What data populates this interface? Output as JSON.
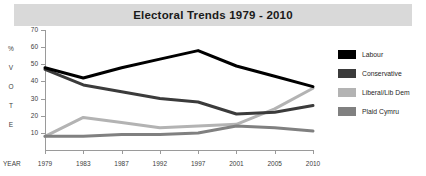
{
  "title": "Electoral Trends 1979 - 2010",
  "axis": {
    "y_letters": [
      "%",
      "V",
      "O",
      "T",
      "E"
    ],
    "y_ticks": [
      70,
      60,
      50,
      40,
      30,
      20,
      10
    ],
    "year_caption": "YEAR"
  },
  "legend": {
    "items": [
      {
        "label": "Labour",
        "color": "#000000"
      },
      {
        "label": "Conservative",
        "color": "#3b3b3b"
      },
      {
        "label": "Liberal/Lib Dem",
        "color": "#b3b3b3"
      },
      {
        "label": "Plaid Cymru",
        "color": "#808080"
      }
    ]
  },
  "chart_data": {
    "type": "line",
    "title": "Electoral Trends 1979 - 2010",
    "xlabel": "YEAR",
    "ylabel": "%VOTE",
    "categories": [
      "1979",
      "1983",
      "1987",
      "1992",
      "1997",
      "2001",
      "2005",
      "2010"
    ],
    "ylim": [
      0,
      70
    ],
    "yticks": [
      10,
      20,
      30,
      40,
      50,
      60,
      70
    ],
    "grid": false,
    "legend_position": "right",
    "series": [
      {
        "name": "Labour",
        "color": "#000000",
        "values": [
          48,
          42,
          48,
          53,
          58,
          49,
          43,
          37
        ]
      },
      {
        "name": "Conservative",
        "color": "#3b3b3b",
        "values": [
          47,
          38,
          34,
          30,
          28,
          21,
          22,
          26
        ]
      },
      {
        "name": "Liberal/Lib Dem",
        "color": "#b3b3b3",
        "values": [
          8,
          19,
          16,
          13,
          14,
          15,
          24,
          36
        ]
      },
      {
        "name": "Plaid Cymru",
        "color": "#808080",
        "values": [
          8,
          8,
          9,
          9,
          10,
          14,
          13,
          11
        ]
      }
    ]
  }
}
